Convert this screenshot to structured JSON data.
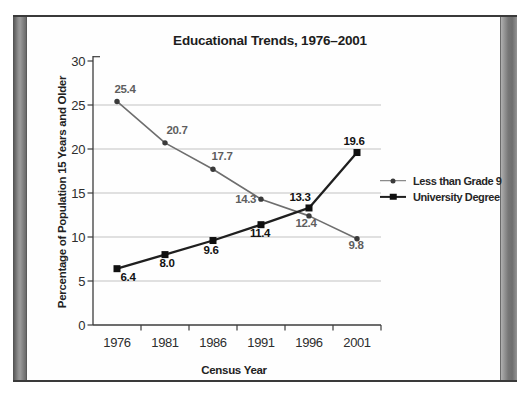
{
  "chart_data": {
    "type": "line",
    "title": "Educational Trends, 1976–2001",
    "xlabel": "Census Year",
    "ylabel": "Percentage of Population 15 Years and Older",
    "categories": [
      "1976",
      "1981",
      "1986",
      "1991",
      "1996",
      "2001"
    ],
    "series": [
      {
        "name": "Less than Grade 9",
        "values": [
          25.4,
          20.7,
          17.7,
          14.3,
          12.4,
          9.8
        ],
        "color": "#6e6e6e",
        "marker_color": "#3a3a3a",
        "label_color": "#5e5e5e",
        "marker": "circle"
      },
      {
        "name": "University Degree",
        "values": [
          6.4,
          8.0,
          9.6,
          11.4,
          13.3,
          19.6
        ],
        "color": "#1f1f1f",
        "marker_color": "#101010",
        "label_color": "#121212",
        "marker": "square"
      }
    ],
    "ylim": [
      0,
      30
    ],
    "yticks": [
      0,
      5,
      10,
      15,
      20,
      25,
      30
    ],
    "grid": "horizontal-only",
    "gridline_color": "#c2c2c2",
    "axis_color": "#3c3c3c",
    "legend_position": "right-middle"
  }
}
